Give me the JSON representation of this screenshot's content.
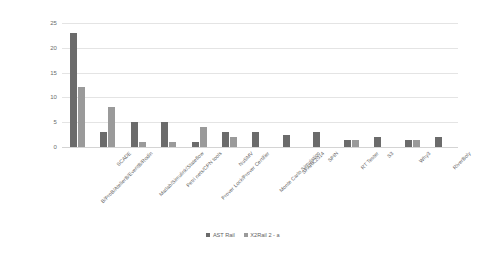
{
  "chart_data": {
    "type": "bar",
    "title": "",
    "subtitle": "",
    "xlabel": "",
    "ylabel": "",
    "ylim": [
      0,
      25
    ],
    "yticks": [
      0,
      5,
      10,
      15,
      20,
      25
    ],
    "grid": true,
    "legend_position": "bottom-center",
    "orientation": "vertical",
    "bar_mode": "grouped",
    "categories": [
      "B/ProB/AtelierB/EventB/Rodin",
      "SCADE",
      "Matlab/Simulink/Stateflow",
      "Petri nets/CPN tools",
      "Prover Lock/Prover Certifier",
      "NuSMV",
      "Monte Carlo Simulation",
      "SPARK2014",
      "SPIN",
      "RT Tester",
      "S3",
      "Why3",
      "RiverBoly"
    ],
    "series": [
      {
        "name": "AST Rail",
        "color": "#6b6b6b",
        "values": [
          23,
          3,
          5,
          5,
          1,
          3,
          3,
          2.5,
          3,
          1.5,
          2,
          1.5,
          2
        ]
      },
      {
        "name": "X2Rail 2 - a",
        "color": "#9a9a9a",
        "values": [
          12,
          8,
          1,
          1,
          4,
          2,
          0,
          0,
          0,
          1.5,
          0,
          1.5,
          0
        ]
      }
    ]
  },
  "legend": {
    "items": [
      {
        "label": "AST Rail",
        "color": "#6b6b6b"
      },
      {
        "label": "X2Rail 2 - a",
        "color": "#9a9a9a"
      }
    ]
  },
  "axes": {
    "y_tick_labels": [
      "0",
      "5",
      "10",
      "15",
      "20",
      "25"
    ]
  },
  "colors": {
    "background": "#ffffff",
    "gridline": "#e4e4e4",
    "axis_text": "#6b6b6b",
    "series_1": "#6b6b6b",
    "series_2": "#9a9a9a"
  }
}
